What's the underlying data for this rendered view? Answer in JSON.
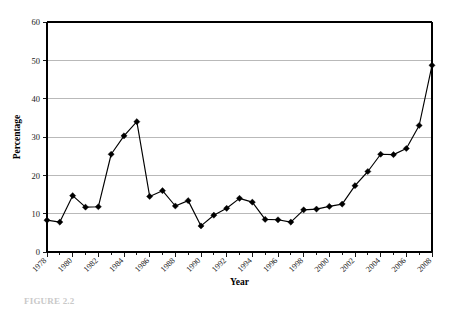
{
  "figure": {
    "caption": "FIGURE 2.2"
  },
  "chart_data": {
    "type": "line",
    "title": "",
    "xlabel": "Year",
    "ylabel": "Percentage",
    "x": [
      1978,
      1979,
      1980,
      1981,
      1982,
      1983,
      1984,
      1985,
      1986,
      1987,
      1988,
      1989,
      1990,
      1991,
      1992,
      1993,
      1994,
      1995,
      1996,
      1997,
      1998,
      1999,
      2000,
      2001,
      2002,
      2003,
      2004,
      2005,
      2006,
      2007,
      2008
    ],
    "values": [
      8.3,
      7.8,
      14.7,
      11.7,
      11.8,
      25.5,
      30.3,
      34.0,
      14.5,
      16.0,
      12.0,
      13.4,
      6.8,
      9.6,
      11.4,
      14.0,
      13.0,
      8.5,
      8.4,
      7.8,
      11.0,
      11.2,
      11.9,
      12.5,
      17.3,
      21.0,
      25.5,
      25.4,
      27.0,
      33.0,
      48.7
    ],
    "xlim": [
      1978,
      2008
    ],
    "ylim": [
      0,
      60
    ],
    "yticks": [
      0,
      10,
      20,
      30,
      40,
      50,
      60
    ],
    "ytick_labels": [
      "0",
      "10",
      "20",
      "30",
      "40",
      "50",
      "60"
    ],
    "xtick_labels": [
      "1978",
      "1980",
      "1982",
      "1984",
      "1986",
      "1988",
      "1990",
      "1992",
      "1994",
      "1996",
      "1998",
      "2000",
      "2002",
      "2004",
      "2006",
      "2008"
    ],
    "xtick_values": [
      1978,
      1980,
      1982,
      1984,
      1986,
      1988,
      1990,
      1992,
      1994,
      1996,
      1998,
      2000,
      2002,
      2004,
      2006,
      2008
    ],
    "grid": "horizontal",
    "legend": "none",
    "marker": "diamond",
    "series_color": "#000000",
    "grid_color": "#a8a8a8",
    "xtick_label_rotation": -45
  }
}
